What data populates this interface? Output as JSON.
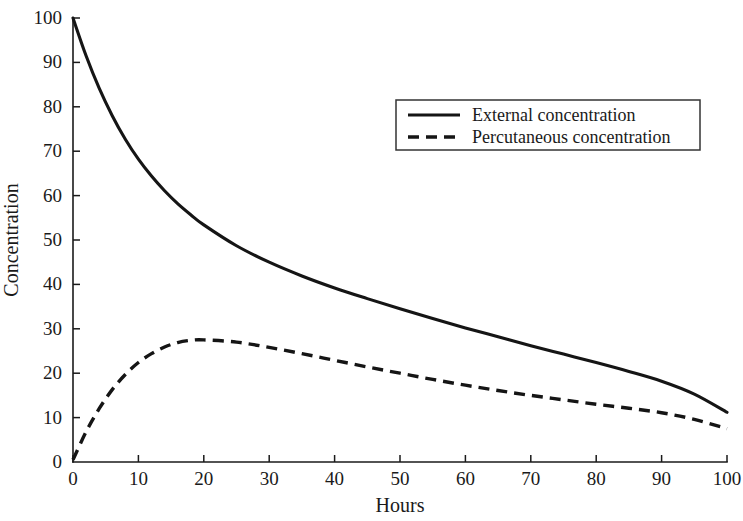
{
  "chart_data": {
    "type": "line",
    "title": "",
    "xlabel": "Hours",
    "ylabel": "Concentration",
    "xlim": [
      0,
      100
    ],
    "ylim": [
      0,
      100
    ],
    "grid": false,
    "legend_position": "top-right",
    "xticks": [
      0,
      10,
      20,
      30,
      40,
      50,
      60,
      70,
      80,
      90,
      100
    ],
    "xtick_labels": [
      "0",
      "10",
      "20",
      "30",
      "40",
      "50",
      "60",
      "70",
      "80",
      "90",
      "100"
    ],
    "yticks": [
      0,
      10,
      20,
      30,
      40,
      50,
      60,
      70,
      80,
      90,
      100
    ],
    "ytick_labels": [
      "0",
      "10",
      "20",
      "30",
      "40",
      "50",
      "60",
      "70",
      "80",
      "90",
      "100"
    ],
    "x": [
      0,
      2,
      4,
      6,
      8,
      10,
      12,
      14,
      16,
      18,
      20,
      25,
      30,
      35,
      40,
      45,
      50,
      55,
      60,
      65,
      70,
      75,
      80,
      85,
      90,
      95,
      100
    ],
    "series": [
      {
        "name": "External concentration",
        "style": "solid",
        "color": "#151515",
        "values": [
          100,
          91.5,
          84.2,
          78.0,
          72.7,
          68.2,
          64.4,
          61.1,
          58.2,
          55.7,
          53.4,
          48.7,
          45.0,
          41.9,
          39.2,
          36.8,
          34.5,
          32.3,
          30.2,
          28.2,
          26.2,
          24.3,
          22.4,
          20.4,
          18.2,
          15.3,
          11.2
        ]
      },
      {
        "name": "Percutaneous concentration",
        "style": "dashed",
        "color": "#151515",
        "values": [
          0.5,
          6.8,
          12.0,
          16.3,
          19.7,
          22.4,
          24.4,
          25.9,
          26.9,
          27.4,
          27.5,
          27.0,
          25.8,
          24.4,
          22.9,
          21.4,
          20.0,
          18.6,
          17.3,
          16.1,
          15.0,
          14.0,
          13.0,
          12.1,
          11.1,
          9.6,
          7.5
        ]
      }
    ]
  },
  "legend": {
    "entries": [
      {
        "label": "External concentration"
      },
      {
        "label": "Percutaneous concentration"
      }
    ]
  }
}
